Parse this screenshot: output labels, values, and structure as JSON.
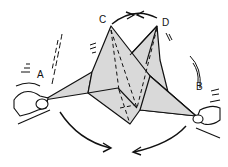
{
  "diagram": {
    "type": "origami-instruction",
    "labels": {
      "a": "A",
      "b": "B",
      "c": "C",
      "d": "D"
    },
    "fill_color": "#d9d9d9",
    "stroke_color": "#111111"
  }
}
